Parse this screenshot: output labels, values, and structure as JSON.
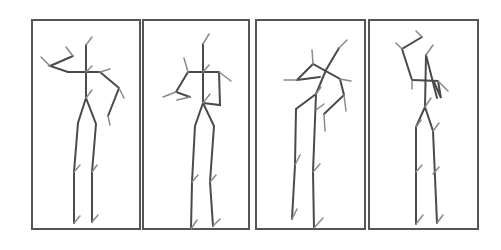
{
  "figure": {
    "type": "stick-figure pose sequence",
    "panel_count": 4,
    "colors": {
      "border": "#555555",
      "bone": "#4a4a4a",
      "joint_tick": "#8a8a8a",
      "background": "#ffffff"
    },
    "panels": [
      {
        "index": 1,
        "pose": "left arm raised bent, right hand on hip"
      },
      {
        "index": 2,
        "pose": "both arms bent in front of torso"
      },
      {
        "index": 3,
        "pose": "torso leaning, arms crossed"
      },
      {
        "index": 4,
        "pose": "left arm raised bent overhead"
      }
    ]
  }
}
